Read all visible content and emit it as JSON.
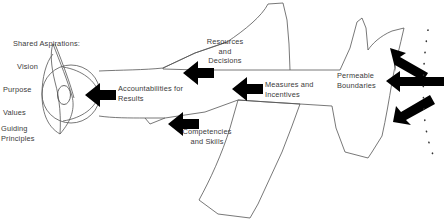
{
  "diagram": {
    "type": "organizational-whale-metaphor",
    "stroke_color": "#555555",
    "arrow_color": "#000000",
    "text_color": "#3a3a3a",
    "background_color": "#ffffff"
  },
  "head_labels": {
    "heading": "Shared Aspirations:",
    "items": [
      {
        "label": "Vision"
      },
      {
        "label": "Purpose"
      },
      {
        "label": "Values"
      },
      {
        "label": "Guiding\nPrinciples"
      }
    ]
  },
  "arrow_labels": [
    {
      "id": "accountabilities",
      "label": "Accountabilities for\nResults",
      "arrow_direction": "left",
      "arrow_name": "accountabilities-arrow"
    },
    {
      "id": "resources",
      "label": "Resources\nand\nDecisions",
      "arrow_direction": "left",
      "arrow_name": "resources-arrow"
    },
    {
      "id": "measures",
      "label": "Measures and\nIncentives",
      "arrow_direction": "left",
      "arrow_name": "measures-arrow"
    },
    {
      "id": "competencies",
      "label": "Competencies\nand Skills",
      "arrow_direction": "left",
      "arrow_name": "competencies-arrow"
    },
    {
      "id": "permeable",
      "label": "Permeable\nBoundaries",
      "arrow_direction": "left",
      "arrow_name": "permeable-boundaries-arrows"
    }
  ],
  "shapes": {
    "head": "circle-with-eye-and-lens",
    "body": "whale-body-outline",
    "dorsal_fin": "upper-triangular-fin",
    "ventral_fin": "lower-quadrilateral-fin",
    "tail": "forked-tail",
    "boundary_marker": "dotted-arc"
  }
}
